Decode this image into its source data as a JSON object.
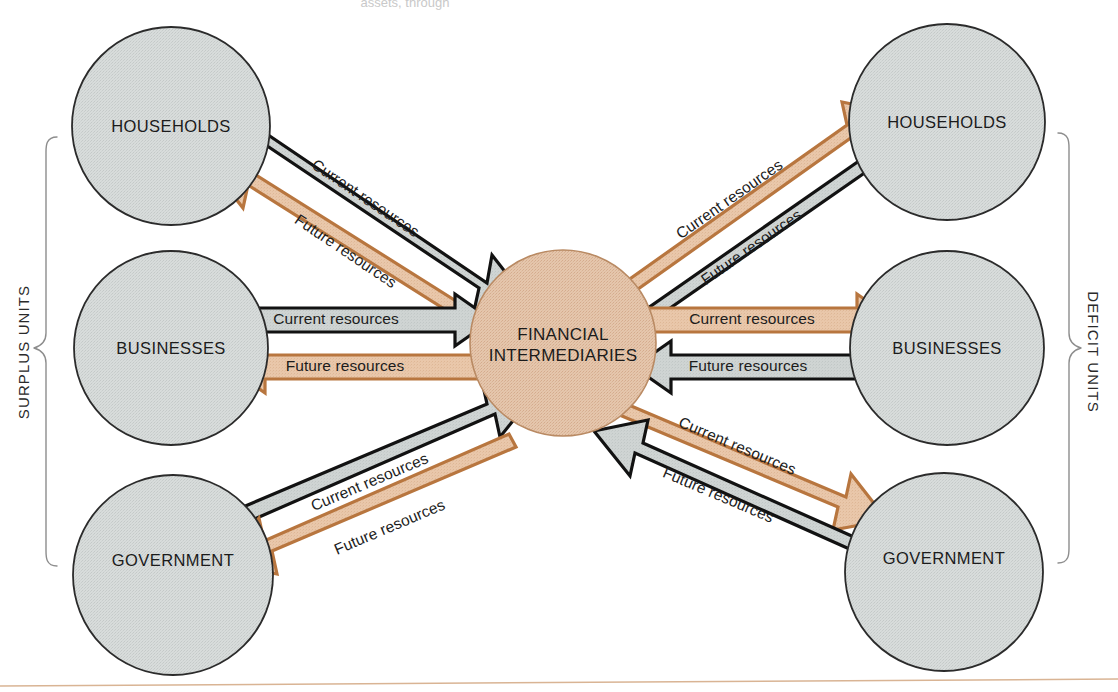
{
  "figure": {
    "title_fragment": "assets, through",
    "hub": {
      "name": "financial-intermediaries",
      "line1": "FINANCIAL",
      "line2": "INTERMEDIARIES",
      "fill": "#e3c3a9",
      "stroke": "#b98a63",
      "cx": 563,
      "cy": 343,
      "r": 93
    },
    "brackets": {
      "left": {
        "label": "SURPLUS UNITS",
        "x": 30,
        "y": 350
      },
      "right": {
        "label": "DEFICIT UNITS",
        "x": 1088,
        "y": 350
      }
    },
    "colors": {
      "node_fill": "#d7dbda",
      "node_stroke": "#2b2b2b",
      "current_dark_fill": "#ccd1d0",
      "current_dark_stroke": "#121212",
      "future_orange_fill": "#e9c6a9",
      "future_orange_stroke": "#b8763f",
      "hub_fill": "#e3c3a9",
      "bracket_stroke": "#8d8d8d",
      "baseline": "#d9b494",
      "background": "#ffffff"
    },
    "labels": {
      "current": "Current resources",
      "future": "Future resources"
    },
    "left_nodes": [
      {
        "name": "surplus-households",
        "label": "HOUSEHOLDS",
        "cx": 171,
        "cy": 126,
        "r": 99
      },
      {
        "name": "surplus-businesses",
        "label": "BUSINESSES",
        "cx": 171,
        "cy": 348,
        "r": 97
      },
      {
        "name": "surplus-government",
        "label": "GOVERNMENT",
        "cx": 173,
        "cy": 575,
        "r": 100
      }
    ],
    "right_nodes": [
      {
        "name": "deficit-households",
        "label": "HOUSEHOLDS",
        "cx": 947,
        "cy": 122,
        "r": 98
      },
      {
        "name": "deficit-businesses",
        "label": "BUSINESSES",
        "cx": 947,
        "cy": 348,
        "r": 97
      },
      {
        "name": "deficit-government",
        "label": "GOVERNMENT",
        "cx": 944,
        "cy": 572,
        "r": 99
      }
    ],
    "flows": [
      {
        "name": "flow-surplus-households-current",
        "label": "Current resources",
        "from": "surplus-households",
        "to": "financial-intermediaries",
        "style": "current-dark",
        "direction": "to-hub"
      },
      {
        "name": "flow-surplus-households-future",
        "label": "Future resources",
        "from": "financial-intermediaries",
        "to": "surplus-households",
        "style": "future-orange",
        "direction": "from-hub"
      },
      {
        "name": "flow-surplus-businesses-current",
        "label": "Current resources",
        "from": "surplus-businesses",
        "to": "financial-intermediaries",
        "style": "current-dark",
        "direction": "to-hub"
      },
      {
        "name": "flow-surplus-businesses-future",
        "label": "Future resources",
        "from": "financial-intermediaries",
        "to": "surplus-businesses",
        "style": "future-orange",
        "direction": "from-hub"
      },
      {
        "name": "flow-surplus-government-current",
        "label": "Current resources",
        "from": "surplus-government",
        "to": "financial-intermediaries",
        "style": "current-dark",
        "direction": "to-hub"
      },
      {
        "name": "flow-surplus-government-future",
        "label": "Future resources",
        "from": "financial-intermediaries",
        "to": "surplus-government",
        "style": "future-orange",
        "direction": "from-hub"
      },
      {
        "name": "flow-deficit-households-current",
        "label": "Current resources",
        "from": "financial-intermediaries",
        "to": "deficit-households",
        "style": "future-orange",
        "direction": "from-hub"
      },
      {
        "name": "flow-deficit-households-future",
        "label": "Future resources",
        "from": "deficit-households",
        "to": "financial-intermediaries",
        "style": "current-dark",
        "direction": "to-hub"
      },
      {
        "name": "flow-deficit-businesses-current",
        "label": "Current resources",
        "from": "financial-intermediaries",
        "to": "deficit-businesses",
        "style": "future-orange",
        "direction": "from-hub"
      },
      {
        "name": "flow-deficit-businesses-future",
        "label": "Future resources",
        "from": "deficit-businesses",
        "to": "financial-intermediaries",
        "style": "current-dark",
        "direction": "to-hub"
      },
      {
        "name": "flow-deficit-government-current",
        "label": "Current resources",
        "from": "financial-intermediaries",
        "to": "deficit-government",
        "style": "future-orange",
        "direction": "from-hub"
      },
      {
        "name": "flow-deficit-government-future",
        "label": "Future resources",
        "from": "deficit-government",
        "to": "financial-intermediaries",
        "style": "current-dark",
        "direction": "to-hub"
      }
    ]
  }
}
